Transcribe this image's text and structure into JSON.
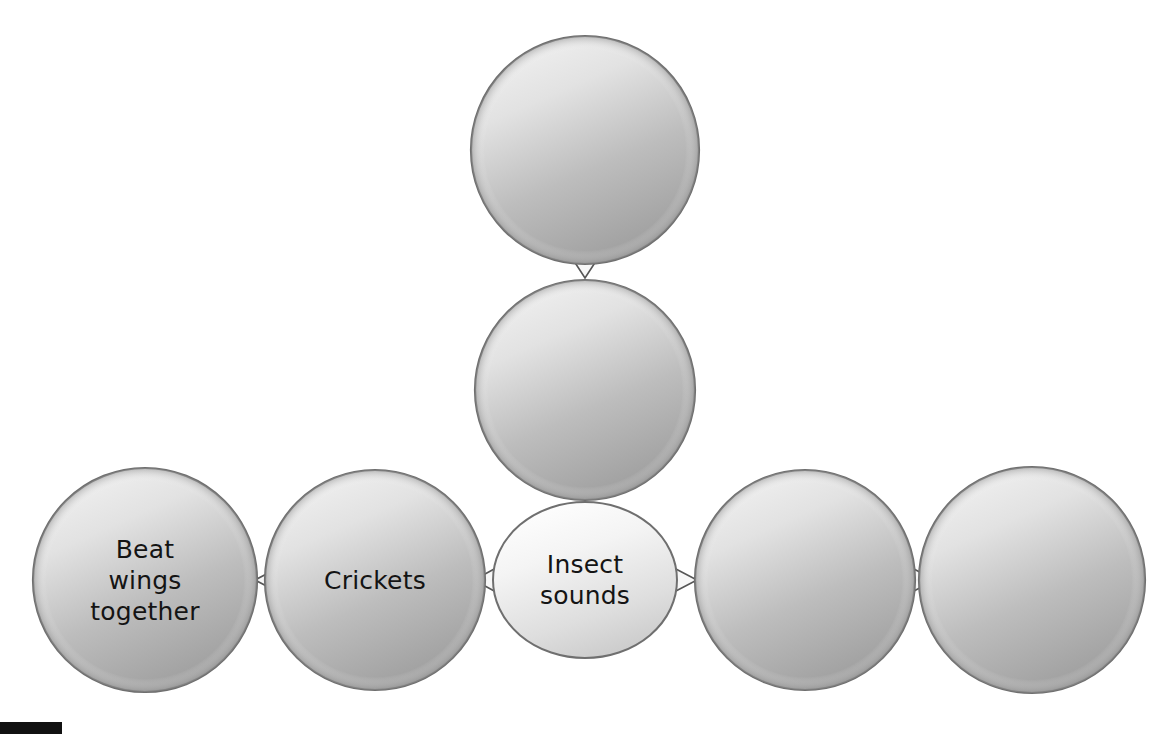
{
  "diagram": {
    "type": "concept-map",
    "background_color": "#ffffff",
    "node_fill_light": "#e8e8e8",
    "node_fill_dark": "#a6a6a6",
    "node_stroke": "#7a7a7a",
    "center_fill_light": "#fdfdfd",
    "center_fill_dark": "#cfcfcf",
    "text_color": "#141414",
    "nodes": [
      {
        "id": "top",
        "shape": "circle",
        "label": "",
        "cx": 585,
        "cy": 150,
        "r": 114,
        "filled": true
      },
      {
        "id": "upper-middle",
        "shape": "circle",
        "label": "",
        "cx": 585,
        "cy": 390,
        "r": 110,
        "filled": true
      },
      {
        "id": "center",
        "shape": "ellipse",
        "label_line1": "Insect",
        "label_line2": "sounds",
        "cx": 585,
        "cy": 580,
        "rx": 92,
        "ry": 78,
        "filled": false
      },
      {
        "id": "crickets",
        "shape": "circle",
        "label": "Crickets",
        "cx": 375,
        "cy": 580,
        "r": 110,
        "filled": true
      },
      {
        "id": "beat-wings",
        "shape": "circle",
        "label_line1": "Beat",
        "label_line2": "wings",
        "label_line3": "together",
        "cx": 145,
        "cy": 580,
        "r": 112,
        "filled": true
      },
      {
        "id": "right-inner",
        "shape": "circle",
        "label": "",
        "cx": 805,
        "cy": 580,
        "r": 110,
        "filled": true
      },
      {
        "id": "right-outer",
        "shape": "circle",
        "label": "",
        "cx": 1032,
        "cy": 580,
        "r": 113,
        "filled": true
      }
    ],
    "connectors": [
      {
        "id": "top-to-uppermiddle",
        "from": "top",
        "to": "upper-middle",
        "orientation": "vertical"
      },
      {
        "id": "uppermiddle-to-center",
        "from": "upper-middle",
        "to": "center",
        "orientation": "vertical"
      },
      {
        "id": "center-to-crickets",
        "from": "center",
        "to": "crickets",
        "orientation": "horizontal"
      },
      {
        "id": "crickets-to-beatwings",
        "from": "crickets",
        "to": "beat-wings",
        "orientation": "horizontal"
      },
      {
        "id": "center-to-rightinner",
        "from": "center",
        "to": "right-inner",
        "orientation": "horizontal"
      },
      {
        "id": "rightinner-to-rightouter",
        "from": "right-inner",
        "to": "right-outer",
        "orientation": "horizontal"
      }
    ],
    "corner_marker": {
      "name": "black-bar",
      "color": "#111111"
    }
  }
}
